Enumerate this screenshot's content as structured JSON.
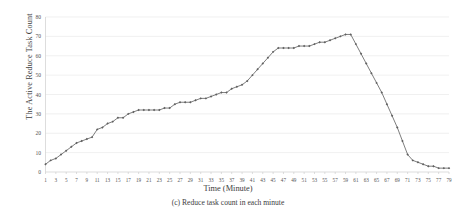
{
  "figure": {
    "caption": "(c) Reduce task count in each minute"
  },
  "chart_data": {
    "type": "line",
    "title": "",
    "xlabel": "Time (Minute)",
    "ylabel": "The Active Reduce Task Count",
    "xlim": [
      1,
      79
    ],
    "ylim": [
      0,
      80
    ],
    "yticks": [
      0,
      10,
      20,
      30,
      40,
      50,
      60,
      70,
      80
    ],
    "xticks": [
      1,
      3,
      5,
      7,
      9,
      11,
      13,
      15,
      17,
      19,
      21,
      23,
      25,
      27,
      29,
      31,
      33,
      35,
      37,
      39,
      41,
      43,
      45,
      47,
      49,
      51,
      53,
      55,
      57,
      59,
      61,
      63,
      65,
      67,
      69,
      71,
      73,
      75,
      77,
      79
    ],
    "grid": true,
    "legend": false,
    "marker": "diamond",
    "line_color": "#6f6f6f",
    "series": [
      {
        "name": "Active Reduce Task Count",
        "x": [
          1,
          2,
          3,
          4,
          5,
          6,
          7,
          8,
          9,
          10,
          11,
          12,
          13,
          14,
          15,
          16,
          17,
          18,
          19,
          20,
          21,
          22,
          23,
          24,
          25,
          26,
          27,
          28,
          29,
          30,
          31,
          32,
          33,
          34,
          35,
          36,
          37,
          38,
          39,
          40,
          41,
          42,
          43,
          44,
          45,
          46,
          47,
          48,
          49,
          50,
          51,
          52,
          53,
          54,
          55,
          56,
          57,
          58,
          59,
          60,
          61,
          62,
          63,
          64,
          65,
          66,
          67,
          68,
          69,
          70,
          71,
          72,
          73,
          74,
          75,
          76,
          77,
          78,
          79
        ],
        "values": [
          4,
          6,
          7,
          9,
          11,
          13,
          15,
          16,
          17,
          18,
          22,
          23,
          25,
          26,
          28,
          28,
          30,
          31,
          32,
          32,
          32,
          32,
          32,
          33,
          33,
          35,
          36,
          36,
          36,
          37,
          38,
          38,
          39,
          40,
          41,
          41,
          43,
          44,
          45,
          47,
          50,
          53,
          56,
          59,
          62,
          64,
          64,
          64,
          64,
          65,
          65,
          65,
          66,
          67,
          67,
          68,
          69,
          70,
          71,
          71,
          66,
          61,
          56,
          51,
          46,
          41,
          35,
          29,
          23,
          16,
          9,
          6,
          5,
          4,
          3,
          3,
          2,
          2,
          2
        ]
      }
    ]
  }
}
